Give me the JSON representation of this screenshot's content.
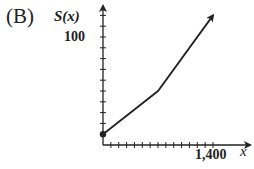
{
  "option": {
    "label": "(B)"
  },
  "chart_data": {
    "type": "line",
    "title": "",
    "xlabel": "x",
    "ylabel": "S(x)",
    "x_tick_labels": [
      "1,400"
    ],
    "y_tick_labels": [
      "100"
    ],
    "x_tick_interval": 100,
    "y_tick_interval": 10,
    "xlim": [
      0,
      1500
    ],
    "ylim": [
      0,
      130
    ],
    "grid": false,
    "legend": null,
    "series": [
      {
        "name": "S(x)",
        "points": [
          [
            0,
            10
          ],
          [
            700,
            50
          ],
          [
            1400,
            120
          ]
        ],
        "start_marker": "closed-dot",
        "end": "arrow"
      }
    ]
  },
  "colors": {
    "ink": "#222222",
    "background": "#ffffff"
  }
}
